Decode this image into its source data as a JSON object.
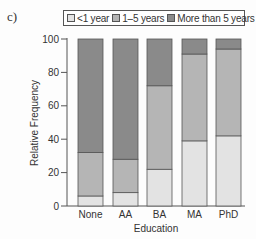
{
  "panel_label": "c)",
  "colors": {
    "lt1": "#e3e3e3",
    "y1to5": "#b5b5b5",
    "gt5": "#8a8a8a",
    "stroke": "#555555"
  },
  "legend": [
    {
      "label": "<1 year",
      "color": "#e3e3e3"
    },
    {
      "label": "1–5 years",
      "color": "#b5b5b5"
    },
    {
      "label": "More than 5 years",
      "color": "#8a8a8a"
    }
  ],
  "chart_data": {
    "type": "bar",
    "stacked": true,
    "title": "",
    "xlabel": "Education",
    "ylabel": "Relative Frequency",
    "categories": [
      "None",
      "AA",
      "BA",
      "MA",
      "PhD"
    ],
    "series": [
      {
        "name": "<1 year",
        "values": [
          6,
          8,
          22,
          39,
          42
        ]
      },
      {
        "name": "1–5 years",
        "values": [
          26,
          20,
          50,
          52,
          52
        ]
      },
      {
        "name": "More than 5 years",
        "values": [
          68,
          72,
          28,
          9,
          6
        ]
      }
    ],
    "ylim": [
      0,
      100
    ],
    "yticks": [
      0,
      20,
      40,
      60,
      80,
      100
    ],
    "grid": false,
    "legend_position": "top"
  }
}
